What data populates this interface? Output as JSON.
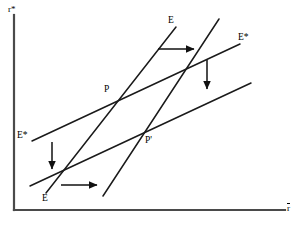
{
  "figure": {
    "kind": "economics-line-diagram",
    "background_color": "#ffffff",
    "line_color": "#1a1a1a",
    "axis_color": "#4a4a4a"
  },
  "axes": {
    "y_label": "r*",
    "x_label": "r",
    "x_label_has_overbar": true,
    "origin": {
      "x": 14,
      "y": 210
    },
    "y_top": {
      "x": 14,
      "y": 15
    },
    "x_right": {
      "x": 285,
      "y": 210
    }
  },
  "curves": [
    {
      "id": "ee-original",
      "label": "E",
      "label_position": {
        "x": 168,
        "y": 16
      },
      "x1": 46,
      "y1": 193,
      "x2": 176,
      "y2": 27
    },
    {
      "id": "ee-shifted",
      "label": "E",
      "label_position": {
        "x": 42,
        "y": 194
      },
      "x1": 103,
      "y1": 196,
      "x2": 219,
      "y2": 19
    },
    {
      "id": "estar-original",
      "label": "E*",
      "label_position": {
        "x": 17,
        "y": 131
      },
      "x1": 32,
      "y1": 141,
      "x2": 240,
      "y2": 44
    },
    {
      "id": "estar-shifted",
      "label": "E*",
      "label_position": {
        "x": 238,
        "y": 33
      },
      "x1": 30,
      "y1": 186,
      "x2": 251,
      "y2": 83
    }
  ],
  "points": [
    {
      "id": "p",
      "label": "P",
      "x": 111,
      "y": 93,
      "label_x": 104,
      "label_y": 85
    },
    {
      "id": "p-prime",
      "label": "P'",
      "x": 150,
      "y": 141,
      "label_x": 145,
      "label_y": 136
    }
  ],
  "arrows": [
    {
      "id": "arrow-top-right",
      "direction": "right",
      "x1": 158,
      "y1": 49,
      "x2": 196,
      "y2": 49
    },
    {
      "id": "arrow-right-down",
      "direction": "down",
      "x1": 207,
      "y1": 60,
      "x2": 207,
      "y2": 92
    },
    {
      "id": "arrow-left-down",
      "direction": "down",
      "x1": 52,
      "y1": 142,
      "x2": 52,
      "y2": 172
    },
    {
      "id": "arrow-bottom-right",
      "direction": "right",
      "x1": 61,
      "y1": 185,
      "x2": 99,
      "y2": 185
    }
  ]
}
